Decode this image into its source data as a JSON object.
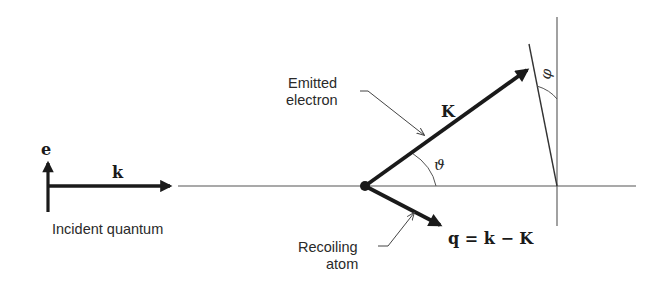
{
  "diagram": {
    "type": "photoelectric-kinematics",
    "labels": {
      "polarization": "e",
      "incident_wavevector": "k",
      "incident": "Incident quantum",
      "emitted_line1": "Emitted",
      "emitted_line2": "electron",
      "electron_momentum": "K",
      "theta": "ϑ",
      "phi": "φ",
      "recoil_line1": "Recoiling",
      "recoil_line2": "atom",
      "recoil_momentum": "q = k − K"
    },
    "colors": {
      "ink": "#1a1a1a",
      "thin_line": "#555555",
      "background": "#ffffff"
    }
  }
}
